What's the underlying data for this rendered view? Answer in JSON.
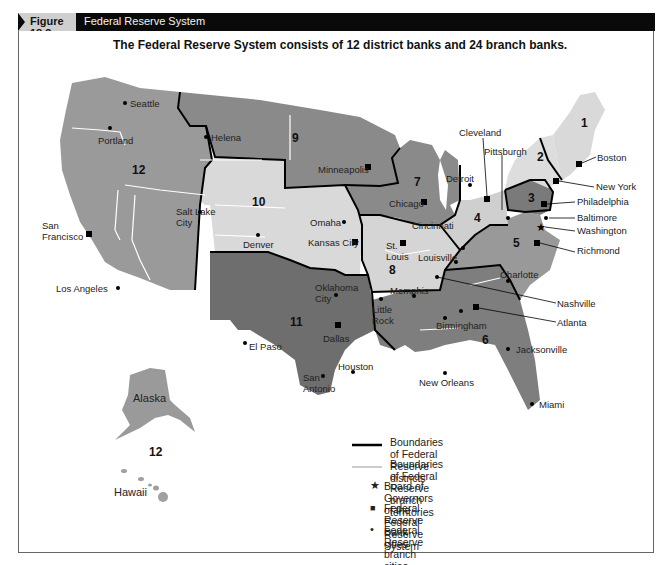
{
  "header": {
    "figure_label": "Figure 18.3",
    "figure_title": "Federal Reserve System"
  },
  "subtitle": "The Federal Reserve System consists of 12 district banks and 24 branch banks.",
  "colors": {
    "header_bg": "#0a0a0a",
    "tab_bg": "#cfcfcf",
    "dark_district": "#7a7a7a",
    "mid_district": "#9a9a9a",
    "light_district": "#d9d9d9",
    "district_boundary": "#000000",
    "branch_boundary": "#ffffff"
  },
  "districts": [
    {
      "number": "1",
      "bank_city": "Boston"
    },
    {
      "number": "2",
      "bank_city": "New York"
    },
    {
      "number": "3",
      "bank_city": "Philadelphia"
    },
    {
      "number": "4",
      "bank_city": "Cleveland"
    },
    {
      "number": "5",
      "bank_city": "Richmond"
    },
    {
      "number": "6",
      "bank_city": "Atlanta"
    },
    {
      "number": "7",
      "bank_city": "Chicago"
    },
    {
      "number": "8",
      "bank_city": "St. Louis"
    },
    {
      "number": "9",
      "bank_city": "Minneapolis"
    },
    {
      "number": "10",
      "bank_city": "Kansas City"
    },
    {
      "number": "11",
      "bank_city": "Dallas"
    },
    {
      "number": "12",
      "bank_city": "San Francisco"
    }
  ],
  "district_labels": {
    "d1": "1",
    "d2": "2",
    "d3": "3",
    "d4": "4",
    "d5": "5",
    "d6": "6",
    "d7": "7",
    "d8": "8",
    "d9": "9",
    "d10": "10",
    "d11": "11",
    "d12": "12",
    "d12_hawaii": "12"
  },
  "cities": {
    "seattle": "Seattle",
    "portland": "Portland",
    "helena": "Helena",
    "san_francisco": "San Francisco",
    "salt_lake_city": "Salt Lake City",
    "los_angeles": "Los Angeles",
    "denver": "Denver",
    "omaha": "Omaha",
    "kansas_city": "Kansas City",
    "oklahoma_city": "Oklahoma City",
    "el_paso": "El Paso",
    "dallas": "Dallas",
    "san_antonio": "San Antonio",
    "houston": "Houston",
    "minneapolis": "Minneapolis",
    "chicago": "Chicago",
    "detroit": "Detroit",
    "st_louis": "St. Louis",
    "little_rock": "Little Rock",
    "memphis": "Memphis",
    "louisville": "Louisville",
    "cincinnati": "Cincinnati",
    "cleveland": "Cleveland",
    "pittsburgh": "Pittsburgh",
    "boston": "Boston",
    "new_york": "New York",
    "philadelphia": "Philadelphia",
    "baltimore": "Baltimore",
    "washington": "Washington",
    "richmond": "Richmond",
    "charlotte": "Charlotte",
    "nashville": "Nashville",
    "atlanta": "Atlanta",
    "birmingham": "Birmingham",
    "jacksonville": "Jacksonville",
    "new_orleans": "New Orleans",
    "miami": "Miami"
  },
  "regions": {
    "alaska": "Alaska",
    "hawaii": "Hawaii"
  },
  "legend": {
    "district_boundaries": "Boundaries of Federal Reserve districts",
    "branch_boundaries": "Boundaries of Federal Reserve branch territories",
    "board_of_governors": "Board of Governors of the Federal Reserve System",
    "bank_cities": "Federal Reserve Bank cities",
    "branch_cities": "Federal Reserve branch cities",
    "star_glyph": "★",
    "square_glyph": "■",
    "dot_glyph": "•"
  }
}
